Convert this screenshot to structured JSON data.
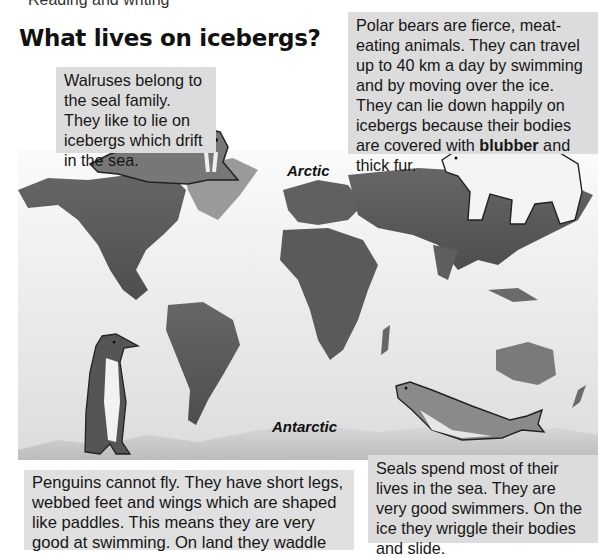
{
  "page": {
    "cut_header": "Reading and writing",
    "title": "What lives on icebergs?"
  },
  "map": {
    "labels": {
      "arctic": "Arctic",
      "antarctic": "Antarctic"
    },
    "style": "grayscale relief world map"
  },
  "animals": [
    {
      "id": "walrus",
      "icon": "walrus-icon"
    },
    {
      "id": "polar-bear",
      "icon": "polar-bear-icon"
    },
    {
      "id": "penguin",
      "icon": "penguin-icon"
    },
    {
      "id": "seal",
      "icon": "seal-icon"
    }
  ],
  "textboxes": {
    "walrus": "Walruses belong to the seal family. They like to lie on icebergs which drift in the sea.",
    "polar_bear_before": "Polar bears are fierce, meat-eating animals. They can travel up to 40 km a day by swimming and by moving over the ice. They can lie down happily on icebergs because their bodies are covered with ",
    "polar_bear_bold": "blubber",
    "polar_bear_after": " and thick fur.",
    "penguin": "Penguins cannot fly. They have short legs, webbed feet and wings which are shaped like paddles. This means they are very good at swimming. On land they waddle",
    "seal": "Seals spend most of their lives in the sea. They are very good swimmers. On the ice they wriggle their bodies and slide."
  },
  "colors": {
    "textbox_bg": "#dcdcdc",
    "land_dark": "#5a5a5a",
    "land_mid": "#7a7a7a",
    "ocean": "#e6e6e6"
  }
}
